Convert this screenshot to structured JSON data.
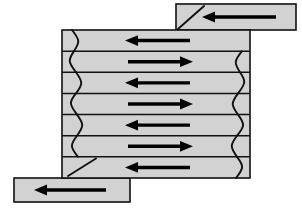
{
  "diagram": {
    "type": "serpentine-flow-diagram",
    "canvas": {
      "width": 302,
      "height": 212,
      "background": "#ffffff"
    },
    "colors": {
      "plate_fill": "#d2d2d2",
      "outline": "#111111",
      "arrow": "#000000",
      "background": "#ffffff"
    },
    "main_plate": {
      "label": "flow-field-plate",
      "x": 62,
      "y": 30,
      "width": 188,
      "height": 148,
      "row_count": 7
    },
    "inlet_tab": {
      "label": "inlet-channel",
      "x": 176,
      "y": 4,
      "width": 120,
      "height": 26,
      "arrow_direction": "left",
      "has_diagonal": true
    },
    "outlet_tab": {
      "label": "outlet-channel",
      "x": 14,
      "y": 178,
      "width": 116,
      "height": 24,
      "arrow_direction": "left",
      "has_diagonal": true
    },
    "channel_rows": [
      {
        "index": 1,
        "direction": "left",
        "y_center": 40.6,
        "arrow_x_start": 190,
        "arrow_x_end": 125
      },
      {
        "index": 2,
        "direction": "right",
        "y_center": 61.8,
        "arrow_x_start": 128,
        "arrow_x_end": 193
      },
      {
        "index": 3,
        "direction": "left",
        "y_center": 83.0,
        "arrow_x_start": 190,
        "arrow_x_end": 125
      },
      {
        "index": 4,
        "direction": "right",
        "y_center": 104.2,
        "arrow_x_start": 128,
        "arrow_x_end": 193
      },
      {
        "index": 5,
        "direction": "left",
        "y_center": 125.4,
        "arrow_x_start": 190,
        "arrow_x_end": 125
      },
      {
        "index": 6,
        "direction": "right",
        "y_center": 146.6,
        "arrow_x_start": 128,
        "arrow_x_end": 193
      },
      {
        "index": 7,
        "direction": "left",
        "y_center": 167.8,
        "arrow_x_start": 190,
        "arrow_x_end": 125
      }
    ],
    "left_turns": [
      {
        "label": "u-turn-left-1-2",
        "connects": [
          1,
          2
        ]
      },
      {
        "label": "u-turn-left-3-4",
        "connects": [
          3,
          4
        ]
      },
      {
        "label": "u-turn-left-5-6",
        "connects": [
          5,
          6
        ]
      }
    ],
    "right_turns": [
      {
        "label": "u-turn-right-2-3",
        "connects": [
          2,
          3
        ]
      },
      {
        "label": "u-turn-right-4-5",
        "connects": [
          4,
          5
        ]
      },
      {
        "label": "u-turn-right-6-7",
        "connects": [
          6,
          7
        ]
      }
    ],
    "inlet_arrow": {
      "x_start": 276,
      "x_end": 202,
      "y": 17
    },
    "outlet_arrow": {
      "x_start": 106,
      "x_end": 34,
      "y": 190
    }
  }
}
